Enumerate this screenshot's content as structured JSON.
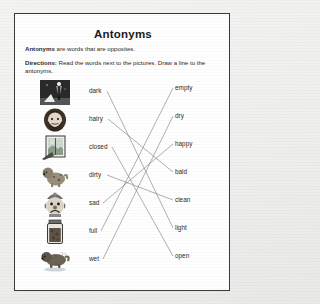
{
  "worksheet": {
    "title": "Antonyms",
    "lead_bold": "Antonyms",
    "lead_rest": " are words that are opposites.",
    "directions_bold": "Directions:",
    "directions_rest": " Read the words next to the pictures. Draw a line to the antonyms.",
    "border_color": "#3a3a3a",
    "paper_color": "#ffffff",
    "line_color": "#6e6e6e"
  },
  "exercise": {
    "left_words": [
      {
        "label": "dark",
        "picture": "night-street-lamp-picture"
      },
      {
        "label": "hairy",
        "picture": "bearded-man-picture"
      },
      {
        "label": "closed",
        "picture": "closed-window-picture"
      },
      {
        "label": "dirty",
        "picture": "dirty-dog-picture"
      },
      {
        "label": "sad",
        "picture": "sad-clown-picture"
      },
      {
        "label": "full",
        "picture": "full-jar-picture"
      },
      {
        "label": "wet",
        "picture": "wet-dog-picture"
      }
    ],
    "right_words": [
      {
        "label": "empty"
      },
      {
        "label": "dry"
      },
      {
        "label": "happy"
      },
      {
        "label": "bald"
      },
      {
        "label": "clean"
      },
      {
        "label": "light"
      },
      {
        "label": "open"
      }
    ],
    "matches": [
      {
        "from": "dark",
        "to": "light"
      },
      {
        "from": "hairy",
        "to": "bald"
      },
      {
        "from": "closed",
        "to": "open"
      },
      {
        "from": "dirty",
        "to": "clean"
      },
      {
        "from": "sad",
        "to": "happy"
      },
      {
        "from": "full",
        "to": "empty"
      },
      {
        "from": "wet",
        "to": "dry"
      }
    ]
  }
}
